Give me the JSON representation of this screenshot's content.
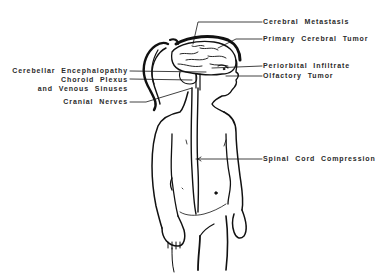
{
  "diagram": {
    "colors": {
      "line": "#111111",
      "text": "#2a2a2a",
      "background": "#ffffff"
    },
    "labels_right": [
      {
        "id": "cerebral-metastasis",
        "text": "Cerebral Metastasis"
      },
      {
        "id": "primary-cerebral-tumor",
        "text": "Primary Cerebral Tumor"
      },
      {
        "id": "periorbital-infiltrate",
        "text": "Periorbital Infiltrate"
      },
      {
        "id": "olfactory-tumor",
        "text": "Olfactory Tumor"
      },
      {
        "id": "spinal-cord-compression",
        "text": "Spinal Cord Compression"
      }
    ],
    "labels_left": [
      {
        "id": "cerebellar-encephalopathy",
        "text": "Cerebellar Encephalopathy"
      },
      {
        "id": "choroid-plexus",
        "text": "Choroid Plexus"
      },
      {
        "id": "venous-sinuses",
        "text": "and Venous Sinuses"
      },
      {
        "id": "cranial-nerves",
        "text": "Cranial Nerves"
      }
    ]
  }
}
